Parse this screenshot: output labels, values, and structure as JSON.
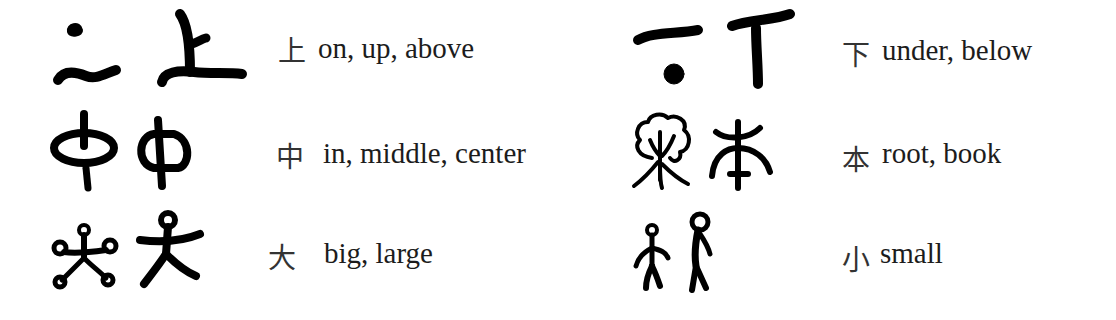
{
  "entries": [
    {
      "id": "shang",
      "modern": "上",
      "meaning": "on, up, above",
      "glyph_icons": [
        "oracle-bone-shang-icon",
        "bronze-shang-icon"
      ]
    },
    {
      "id": "xia",
      "modern": "下",
      "meaning": "under, below",
      "glyph_icons": [
        "oracle-bone-xia-icon",
        "bronze-xia-icon"
      ]
    },
    {
      "id": "zhong",
      "modern": "中",
      "meaning": "in, middle, center",
      "glyph_icons": [
        "oracle-bone-zhong-icon",
        "bronze-zhong-icon"
      ]
    },
    {
      "id": "ben",
      "modern": "本",
      "meaning": "root, book",
      "glyph_icons": [
        "tree-roots-ben-icon",
        "seal-ben-icon"
      ]
    },
    {
      "id": "da",
      "modern": "大",
      "meaning": "big, large",
      "glyph_icons": [
        "oracle-bone-da-icon",
        "bronze-da-icon"
      ]
    },
    {
      "id": "xiao",
      "modern": "小",
      "meaning": "small",
      "glyph_icons": [
        "small-figure-icon",
        "tall-figure-icon"
      ]
    }
  ],
  "colors": {
    "ink": "#000000",
    "text": "#1c1c1c",
    "background": "#ffffff"
  }
}
